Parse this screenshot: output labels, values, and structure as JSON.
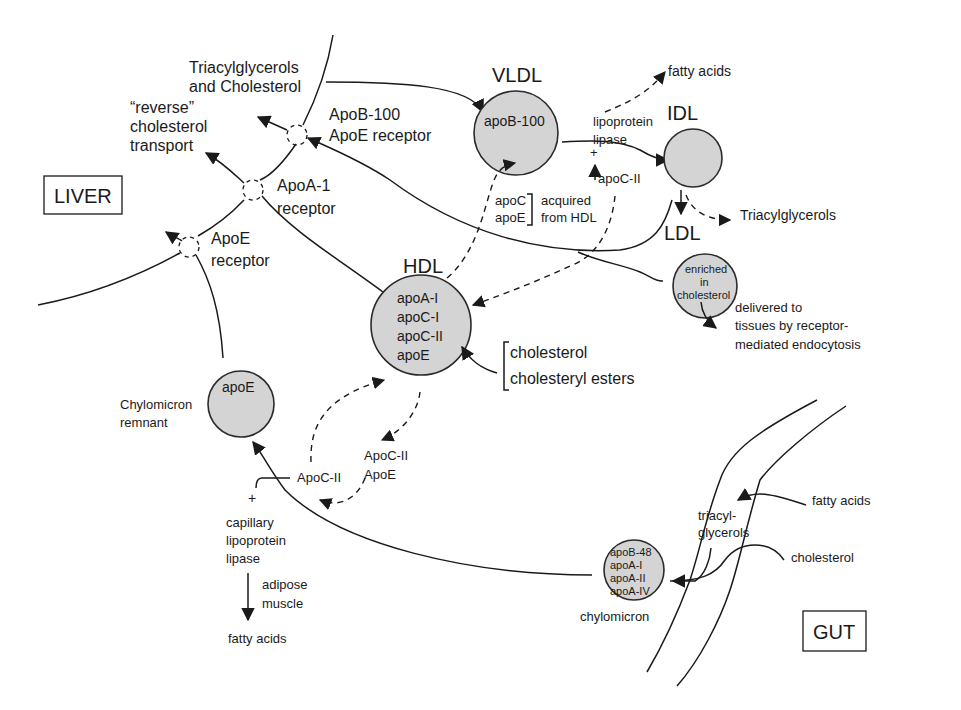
{
  "diagram": {
    "regions": {
      "liver": "LIVER",
      "gut": "GUT"
    },
    "lipoproteins": {
      "vldl": {
        "label": "VLDL",
        "contents": [
          "apoB-100"
        ]
      },
      "idl": {
        "label": "IDL",
        "contents": []
      },
      "ldl": {
        "label": "LDL",
        "contents": [
          "enriched",
          "in",
          "cholesterol"
        ]
      },
      "hdl": {
        "label": "HDL",
        "contents": [
          "apoA-I",
          "apoC-I",
          "apoC-II",
          "apoE"
        ]
      },
      "chylomicron_remnant": {
        "label_lines": [
          "Chylomicron",
          "remnant"
        ],
        "contents": [
          "apoE"
        ]
      },
      "chylomicron": {
        "label": "chylomicron",
        "contents": [
          "apoB-48",
          "apoA-I",
          "apoA-II",
          "apoA-IV"
        ]
      }
    },
    "receptors": {
      "apob_apoe": [
        "ApoB-100",
        "ApoE receptor"
      ],
      "apoa1": [
        "ApoA-1",
        "receptor"
      ],
      "apoe": [
        "ApoE",
        "receptor"
      ]
    },
    "labels": {
      "tag_chol": [
        "Triacylglycerols",
        "and Cholesterol"
      ],
      "reverse_transport": [
        "“reverse”",
        "cholesterol",
        "transport"
      ],
      "fatty_acids_top": "fatty acids",
      "lipoprotein_lipase": [
        "lipoprotein",
        "lipase"
      ],
      "plus_top": "+",
      "apoc2_top": "apoC-II",
      "apoc_apoe": [
        "apoC",
        "apoE"
      ],
      "acquired_from_hdl": [
        "acquired",
        "from HDL"
      ],
      "triacylglycerols_right": "Triacylglycerols",
      "delivered": [
        "delivered to",
        "tissues by receptor-",
        "mediated endocytosis"
      ],
      "cholesterol_esters": [
        "cholesterol",
        "cholesteryl esters"
      ],
      "apoc2_apoe": [
        "ApoC-II",
        "ApoE"
      ],
      "apoc2_left": "ApoC-II",
      "plus_bottom": "+",
      "capillary_lipase": [
        "capillary",
        "lipoprotein",
        "lipase"
      ],
      "adipose_muscle": [
        "adipose",
        "muscle"
      ],
      "fatty_acids_bottom": "fatty acids",
      "triacylglycerols_gut": [
        "triacyl-",
        "glycerols"
      ],
      "fatty_acids_gut": "fatty acids",
      "cholesterol_gut": "cholesterol"
    }
  }
}
